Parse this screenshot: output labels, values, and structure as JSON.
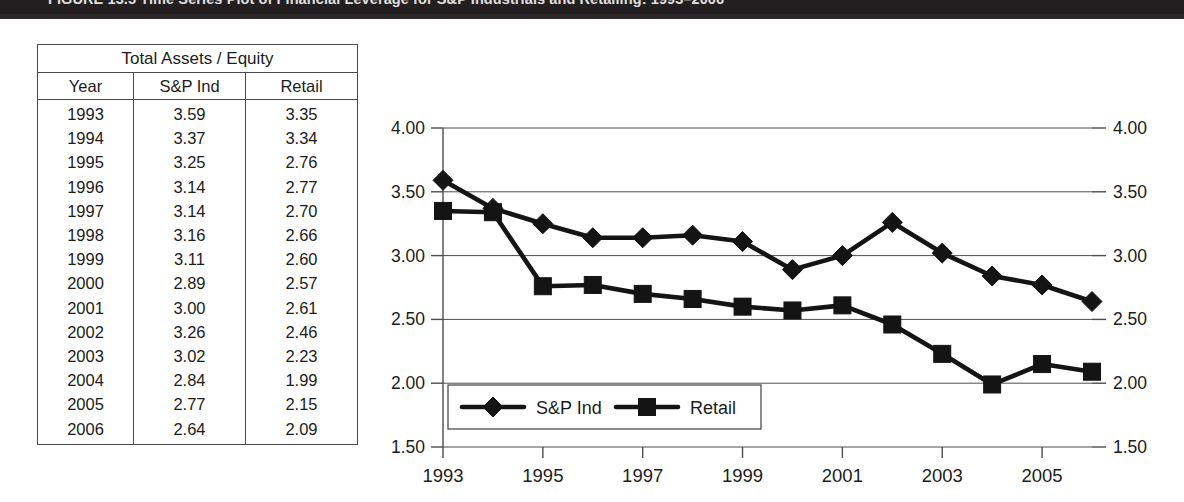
{
  "banner": {
    "caption": "FIGURE 13.5   Time Series Plot of Financial Leverage for S&P Industrials and Retailing: 1993–2006",
    "background_color": "#231f20",
    "text_color": "#f2f0ee"
  },
  "table": {
    "title": "Total Assets / Equity",
    "columns": [
      "Year",
      "S&P Ind",
      "Retail"
    ],
    "rows": [
      [
        "1993",
        "3.59",
        "3.35"
      ],
      [
        "1994",
        "3.37",
        "3.34"
      ],
      [
        "1995",
        "3.25",
        "2.76"
      ],
      [
        "1996",
        "3.14",
        "2.77"
      ],
      [
        "1997",
        "3.14",
        "2.70"
      ],
      [
        "1998",
        "3.16",
        "2.66"
      ],
      [
        "1999",
        "3.11",
        "2.60"
      ],
      [
        "2000",
        "2.89",
        "2.57"
      ],
      [
        "2001",
        "3.00",
        "2.61"
      ],
      [
        "2002",
        "3.26",
        "2.46"
      ],
      [
        "2003",
        "3.02",
        "2.23"
      ],
      [
        "2004",
        "2.84",
        "1.99"
      ],
      [
        "2005",
        "2.77",
        "2.15"
      ],
      [
        "2006",
        "2.64",
        "2.09"
      ]
    ]
  },
  "chart_data": {
    "type": "line",
    "title": "",
    "xlabel": "",
    "ylabel": "",
    "x": [
      1993,
      1994,
      1995,
      1996,
      1997,
      1998,
      1999,
      2000,
      2001,
      2002,
      2003,
      2004,
      2005,
      2006
    ],
    "categories": [
      "1993",
      "1994",
      "1995",
      "1996",
      "1997",
      "1998",
      "1999",
      "2000",
      "2001",
      "2002",
      "2003",
      "2004",
      "2005",
      "2006"
    ],
    "series": [
      {
        "name": "S&P Ind",
        "marker": "diamond",
        "color": "#141414",
        "values": [
          3.59,
          3.37,
          3.25,
          3.14,
          3.14,
          3.16,
          3.11,
          2.89,
          3.0,
          3.26,
          3.02,
          2.84,
          2.77,
          2.64
        ]
      },
      {
        "name": "Retail",
        "marker": "square",
        "color": "#141414",
        "values": [
          3.35,
          3.34,
          2.76,
          2.77,
          2.7,
          2.66,
          2.6,
          2.57,
          2.61,
          2.46,
          2.23,
          1.99,
          2.15,
          2.09
        ]
      }
    ],
    "ylim": [
      1.5,
      4.0
    ],
    "ytick_values": [
      1.5,
      2.0,
      2.5,
      3.0,
      3.5,
      4.0
    ],
    "ytick_labels_left": [
      "1.50",
      "2.00",
      "2.50",
      "3.00",
      "3.50",
      "4.00"
    ],
    "ytick_labels_right": [
      "1.50",
      "2.00",
      "2.50",
      "3.00",
      "3.50",
      "4.00"
    ],
    "xtick_values": [
      1993,
      1995,
      1997,
      1999,
      2001,
      2003,
      2005
    ],
    "xtick_labels": [
      "1993",
      "1995",
      "1997",
      "1999",
      "2001",
      "2003",
      "2005"
    ],
    "xlim": [
      1993,
      2006
    ],
    "grid": true,
    "grid_axis": "y",
    "legend_position": "inside-bottom-left",
    "dual_y_axis": true
  }
}
